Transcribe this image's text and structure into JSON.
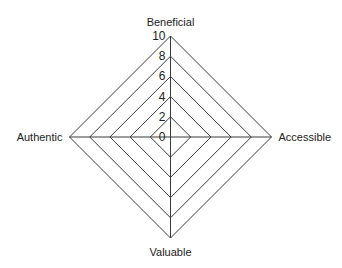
{
  "chart_data": {
    "type": "radar",
    "title": "",
    "axes": [
      "Beneficial",
      "Accessible",
      "Valuable",
      "Authentic"
    ],
    "radial_ticks": [
      "0",
      "2",
      "4",
      "6",
      "8",
      "10"
    ],
    "radial_range": [
      0,
      10
    ],
    "grid": true,
    "grid_shape": "polygon",
    "series": [],
    "legend": null,
    "colors": {
      "grid": "#3a3a3a",
      "text": "#222222",
      "background": "#ffffff"
    }
  },
  "layout": {
    "center": [
      170.5,
      137
    ],
    "radius": 101
  }
}
